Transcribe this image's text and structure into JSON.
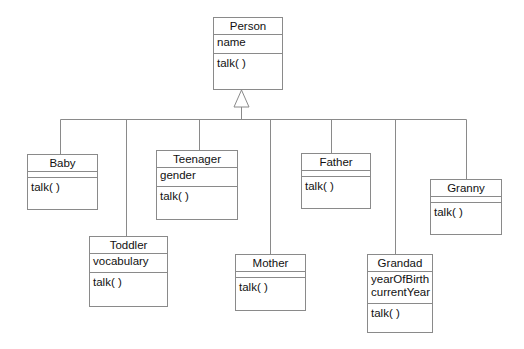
{
  "diagram": {
    "type": "UML class diagram (inheritance)",
    "parent": {
      "name": "Person",
      "attributes": [
        "name"
      ],
      "operations": [
        "talk( )"
      ]
    },
    "children": [
      {
        "name": "Baby",
        "attributes": [],
        "operations": [
          "talk( )"
        ]
      },
      {
        "name": "Toddler",
        "attributes": [
          "vocabulary"
        ],
        "operations": [
          "talk( )"
        ]
      },
      {
        "name": "Teenager",
        "attributes": [
          "gender"
        ],
        "operations": [
          "talk( )"
        ]
      },
      {
        "name": "Mother",
        "attributes": [],
        "operations": [
          "talk( )"
        ]
      },
      {
        "name": "Father",
        "attributes": [],
        "operations": [
          "talk( )"
        ]
      },
      {
        "name": "Grandad",
        "attributes": [
          "yearOfBirth",
          "currentYear"
        ],
        "operations": [
          "talk( )"
        ]
      },
      {
        "name": "Granny",
        "attributes": [],
        "operations": [
          "talk( )"
        ]
      }
    ],
    "relationship": "generalization",
    "line_color": "#8a8a8a"
  }
}
